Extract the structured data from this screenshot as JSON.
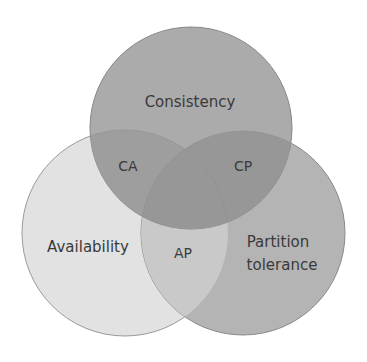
{
  "diagram": {
    "type": "venn",
    "colors": {
      "background": "#ffffff",
      "consistency_fill": "#a8a8a8",
      "availability_fill": "#e2e2e2",
      "partition_fill": "#b4b4b4",
      "ca_overlap": "#9c9c9c",
      "cp_overlap": "#959595",
      "ap_overlap": "#c8c8c8",
      "stroke": "#8a8a8a",
      "text": "#3a3a3a"
    },
    "sets": [
      {
        "id": "consistency",
        "label": "Consistency"
      },
      {
        "id": "availability",
        "label": "Availability"
      },
      {
        "id": "partition",
        "label_line1": "Partition",
        "label_line2": "tolerance"
      }
    ],
    "intersections": [
      {
        "id": "ca",
        "label": "CA"
      },
      {
        "id": "cp",
        "label": "CP"
      },
      {
        "id": "ap",
        "label": "AP"
      }
    ]
  }
}
